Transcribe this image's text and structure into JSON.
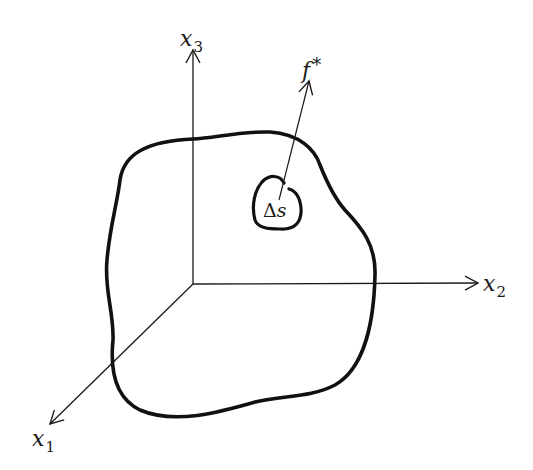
{
  "diagram": {
    "type": "3d-coordinate-body-with-surface-force",
    "colors": {
      "stroke": "#1a1a1a",
      "background": "#ffffff"
    },
    "axes": {
      "x1": {
        "symbol": "x",
        "subscript": "1",
        "direction": "out-of-page (lower-left)"
      },
      "x2": {
        "symbol": "x",
        "subscript": "2",
        "direction": "right"
      },
      "x3": {
        "symbol": "x",
        "subscript": "3",
        "direction": "up"
      }
    },
    "body": {
      "description": "closed irregular boundary surface"
    },
    "surface_element": {
      "delta": "Δ",
      "symbol": "s",
      "description": "small surface patch ΔS on body boundary"
    },
    "force": {
      "symbol": "f",
      "superscript": "*",
      "description": "surface traction vector acting on ΔS"
    }
  }
}
